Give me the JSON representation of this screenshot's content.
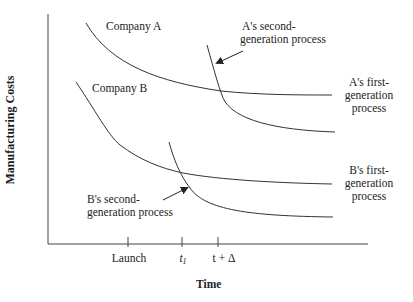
{
  "diagram": {
    "axes": {
      "y_label": "Manufacturing Costs",
      "x_label": "Time",
      "x_ticks": [
        {
          "label": "Launch",
          "x": 128
        },
        {
          "label": "t",
          "sub": "1",
          "x": 182
        },
        {
          "label": "t + Δ",
          "x": 218
        }
      ]
    },
    "labels": {
      "company_a": "Company A",
      "company_b": "Company B",
      "a_second_line1": "A's second-",
      "a_second_line2": "generation process",
      "a_first_line1": "A's first-",
      "a_first_line2": "generation",
      "a_first_line3": "process",
      "b_first_line1": "B's first-",
      "b_first_line2": "generation",
      "b_first_line3": "process",
      "b_second_line1": "B's second-",
      "b_second_line2": "generation process"
    },
    "curves": [
      {
        "name": "A first-generation process",
        "path": "M86,23 C110,65 160,82 221,91 C260,95 300,95 332,95"
      },
      {
        "name": "A second-generation process",
        "path": "M207,45 C214,70 218,85 223,98 C233,120 275,130 335,132"
      },
      {
        "name": "B first-generation process",
        "path": "M76,82 C95,110 108,135 120,145 C140,160 160,168 183,173 C220,180 280,183 332,184"
      },
      {
        "name": "B second-generation process",
        "path": "M169,142 C174,160 180,175 190,188 C205,210 250,216 333,217"
      }
    ],
    "colors": {
      "line": "#333333",
      "text": "#222222",
      "background": "#ffffff"
    }
  }
}
